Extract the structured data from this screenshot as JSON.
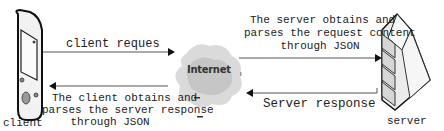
{
  "nodes": {
    "client": {
      "label": "client",
      "icon": "mobile-device-icon"
    },
    "internet": {
      "label": "Internet",
      "icon": "cloud-icon"
    },
    "server": {
      "label": "server",
      "icon": "server-rack-icon"
    }
  },
  "edges": {
    "client_request": {
      "label": "client reques"
    },
    "client_parse": {
      "lines": [
        "The client obtains and",
        "parses the server response",
        "through JSON"
      ]
    },
    "server_parse": {
      "lines": [
        "The server obtains and",
        "parses the request content",
        "through JSON"
      ]
    },
    "server_response": {
      "label": "Server response"
    }
  },
  "colors": {
    "line": "#555555",
    "arrow": "#111111",
    "cloud": "#cfcfcf"
  }
}
